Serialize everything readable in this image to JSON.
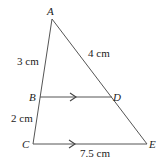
{
  "diagram": {
    "type": "triangle-with-parallel-line",
    "vertices": {
      "A": {
        "label": "A"
      },
      "B": {
        "label": "B"
      },
      "C": {
        "label": "C"
      },
      "D": {
        "label": "D"
      },
      "E": {
        "label": "E"
      }
    },
    "measurements": {
      "AB": "3 cm",
      "AD": "4 cm",
      "BC": "2 cm",
      "CE": "7.5 cm"
    },
    "parallel_segments": [
      "BD",
      "CE"
    ],
    "colors": {
      "line": "#555555",
      "text": "#222222",
      "background": "#ffffff"
    }
  }
}
